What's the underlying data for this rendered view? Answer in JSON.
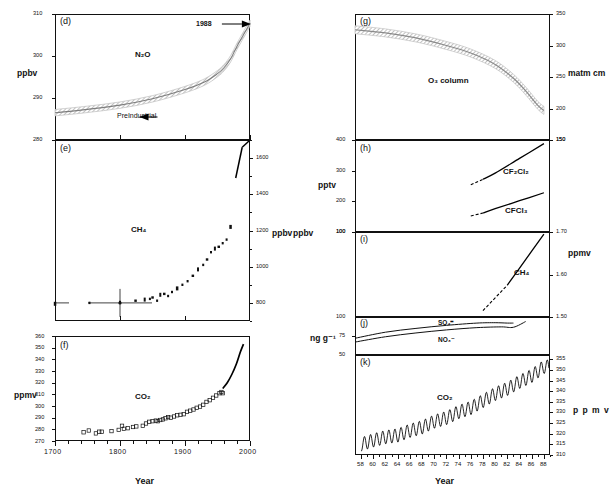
{
  "figure": {
    "title": "",
    "xaxis_label_left": "Year",
    "xaxis_label_right": "Year"
  },
  "panels": {
    "d": {
      "letter": "(d)",
      "species": "N₂O",
      "yunit": "ppbv",
      "yticks": [
        "280",
        "290",
        "300",
        "310"
      ],
      "ann_year": "1988",
      "ann_preindustrial": "PreIndustrial"
    },
    "e": {
      "letter": "(e)",
      "species": "CH₄",
      "yunit": "ppbv",
      "yticks": [
        "800",
        "1000",
        "1200",
        "1400",
        "1600"
      ]
    },
    "f": {
      "letter": "(f)",
      "species": "CO₂",
      "yunit": "ppmv",
      "yticks": [
        "270",
        "280",
        "290",
        "300",
        "310",
        "320",
        "330",
        "340",
        "350",
        "360"
      ]
    },
    "g": {
      "letter": "(g)",
      "species": "O₃ column",
      "yunit": "matm cm",
      "yticks": [
        "150",
        "200",
        "250",
        "300",
        "350"
      ]
    },
    "h": {
      "letter": "(h)",
      "species_a": "CF₂Cl₂",
      "species_b": "CFCl₃",
      "yunit": "pptv",
      "yticks": [
        "100",
        "200",
        "300",
        "400"
      ],
      "yticks_right": [
        "150"
      ]
    },
    "i": {
      "letter": "(i)",
      "species": "CH₄",
      "yunit_left": "ppbv",
      "yunit_right": "ppmv",
      "ytick_left": "100",
      "yticks_right": [
        "1.50",
        "1.60",
        "1.70"
      ]
    },
    "j": {
      "letter": "(j)",
      "species_a": "SO₄⁼",
      "species_b": "NO₃⁻",
      "yunit": "ng g⁻¹",
      "yticks": [
        "50",
        "75",
        "100"
      ]
    },
    "k": {
      "letter": "(k)",
      "species": "CO₂",
      "yunit": "p p m v",
      "yticks": [
        "310",
        "315",
        "320",
        "325",
        "330",
        "335",
        "340",
        "345",
        "350",
        "355"
      ]
    }
  },
  "xaxis_left": {
    "ticks": [
      "1700",
      "1800",
      "1900",
      "2000"
    ],
    "range": [
      1700,
      2000
    ]
  },
  "xaxis_right": {
    "ticks": [
      "58",
      "60",
      "62",
      "64",
      "66",
      "68",
      "70",
      "72",
      "74",
      "76",
      "78",
      "80",
      "82",
      "84",
      "86",
      "88"
    ],
    "range": [
      57,
      89
    ]
  },
  "chart_data": [
    {
      "id": "d",
      "type": "area",
      "title": "(d) N2O",
      "xlabel": "Year",
      "ylabel": "ppbv",
      "xlim": [
        1700,
        2000
      ],
      "ylim": [
        280,
        310
      ],
      "grid": false,
      "series": [
        {
          "name": "N2O band (ice core + atmospheric)",
          "x": [
            1700,
            1750,
            1800,
            1850,
            1900,
            1930,
            1950,
            1960,
            1970,
            1980,
            1988,
            2000
          ],
          "values": [
            286.5,
            287.3,
            288.3,
            289.8,
            292.0,
            293.8,
            295.8,
            297.2,
            299.3,
            302.3,
            304.5,
            307.8
          ]
        }
      ],
      "annotations": [
        "1988",
        "PreIndustrial"
      ]
    },
    {
      "id": "e",
      "type": "scatter",
      "title": "(e) CH4",
      "xlabel": "Year",
      "ylabel": "ppbv",
      "xlim": [
        1700,
        2000
      ],
      "ylim": [
        700,
        1700
      ],
      "grid": false,
      "series": [
        {
          "name": "CH4 ice core data",
          "x": [
            1700,
            1753,
            1800,
            1824,
            1838,
            1846,
            1850,
            1857,
            1862,
            1868,
            1874,
            1880,
            1888,
            1896,
            1904,
            1912,
            1920,
            1928,
            1934,
            1940,
            1946,
            1952,
            1958,
            1964,
            1970
          ],
          "values": [
            795,
            800,
            805,
            812,
            818,
            822,
            830,
            812,
            845,
            850,
            838,
            860,
            880,
            900,
            920,
            950,
            985,
            1010,
            1040,
            1080,
            1100,
            1110,
            1130,
            1150,
            1220
          ]
        },
        {
          "name": "CH4 modern atmospheric record",
          "x": [
            1978,
            1988
          ],
          "values": [
            1490,
            1660
          ]
        }
      ],
      "annotations": [
        "error bar at 1800"
      ]
    },
    {
      "id": "f",
      "type": "scatter",
      "title": "(f) CO2",
      "xlabel": "Year",
      "ylabel": "ppmv",
      "xlim": [
        1700,
        2000
      ],
      "ylim": [
        270,
        360
      ],
      "grid": false,
      "series": [
        {
          "name": "CO2 ice core data",
          "x": [
            1744,
            1752,
            1763,
            1768,
            1772,
            1787,
            1798,
            1803,
            1806,
            1812,
            1820,
            1825,
            1835,
            1840,
            1845,
            1850,
            1855,
            1858,
            1862,
            1866,
            1870,
            1874,
            1878,
            1883,
            1888,
            1893,
            1898,
            1903,
            1908,
            1913,
            1918,
            1923,
            1928,
            1933,
            1938,
            1943,
            1948,
            1953,
            1956,
            1958
          ],
          "values": [
            277.5,
            279,
            276.5,
            278,
            278,
            278.5,
            279.5,
            283,
            280.5,
            281,
            282,
            282.5,
            283,
            285,
            286.5,
            287,
            287.5,
            287,
            288,
            288.5,
            289.5,
            290.5,
            290,
            291,
            292,
            292.5,
            293,
            295,
            296,
            297,
            298.5,
            299.5,
            301,
            303.5,
            305,
            307,
            309,
            311,
            312,
            311
          ]
        },
        {
          "name": "CO2 Mauna Loa record",
          "x": [
            1958,
            1965,
            1972,
            1979,
            1985,
            1990
          ],
          "values": [
            315,
            320,
            327,
            336,
            346,
            353
          ]
        }
      ]
    },
    {
      "id": "g",
      "type": "area",
      "title": "(g) O3 column",
      "xlabel": "Year",
      "ylabel": "matm cm",
      "xlim": [
        1957,
        1989
      ],
      "ylim": [
        150,
        350
      ],
      "grid": false,
      "series": [
        {
          "name": "Antarctic O3 column band",
          "x": [
            1957,
            1962,
            1967,
            1972,
            1976,
            1980,
            1983,
            1985,
            1987,
            1988
          ],
          "values": [
            325,
            320,
            312,
            300,
            288,
            270,
            248,
            228,
            205,
            197
          ]
        }
      ]
    },
    {
      "id": "h",
      "type": "line",
      "title": "(h) CFCs",
      "xlabel": "Year",
      "ylabel": "pptv",
      "xlim": [
        1957,
        1989
      ],
      "ylim": [
        100,
        400
      ],
      "grid": false,
      "series": [
        {
          "name": "CF2Cl2",
          "x": [
            1976,
            1978,
            1980,
            1984,
            1988
          ],
          "values": [
            254,
            272,
            292,
            340,
            388
          ]
        },
        {
          "name": "CFCl3",
          "x": [
            1976,
            1978,
            1980,
            1984,
            1988
          ],
          "values": [
            152,
            162,
            176,
            202,
            228
          ]
        }
      ]
    },
    {
      "id": "i",
      "type": "line",
      "title": "(i) CH4",
      "xlabel": "Year",
      "ylabel": "ppmv",
      "xlim": [
        1957,
        1989
      ],
      "ylim": [
        1.5,
        1.7
      ],
      "grid": false,
      "series": [
        {
          "name": "CH4",
          "x": [
            1978,
            1982,
            1985,
            1988
          ],
          "values": [
            1.515,
            1.575,
            1.635,
            1.695
          ]
        }
      ]
    },
    {
      "id": "j",
      "type": "line",
      "title": "(j) Ice-core ions",
      "xlabel": "Year",
      "ylabel": "ng g-1",
      "xlim": [
        1957,
        1989
      ],
      "ylim": [
        50,
        100
      ],
      "grid": false,
      "series": [
        {
          "name": "SO4=",
          "x": [
            1957,
            1962,
            1967,
            1972,
            1977,
            1980,
            1982,
            1983
          ],
          "values": [
            72,
            80,
            85,
            89,
            92,
            92.5,
            92,
            92
          ]
        },
        {
          "name": "NO3-",
          "x": [
            1957,
            1962,
            1967,
            1972,
            1977,
            1981,
            1983,
            1985
          ],
          "values": [
            67,
            74,
            79,
            83,
            86,
            87,
            86.5,
            94
          ]
        }
      ]
    },
    {
      "id": "k",
      "type": "line",
      "title": "(k) CO2 Mauna Loa",
      "xlabel": "Year",
      "ylabel": "p p m v",
      "xlim": [
        1957,
        1989
      ],
      "ylim": [
        310,
        357
      ],
      "grid": false,
      "series": [
        {
          "name": "Monthly mean CO2 (seasonal cycle superimposed on rising trend)",
          "x": [
            1958,
            1960,
            1962,
            1964,
            1966,
            1968,
            1970,
            1972,
            1974,
            1976,
            1978,
            1980,
            1982,
            1984,
            1986,
            1988
          ],
          "values": [
            315,
            316.9,
            318.4,
            319.2,
            321.4,
            323.0,
            325.7,
            327.4,
            330.2,
            332.1,
            335.4,
            338.7,
            341.1,
            344.4,
            347.2,
            351.5
          ],
          "amplitude": 3.2
        }
      ]
    }
  ]
}
